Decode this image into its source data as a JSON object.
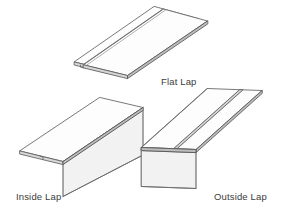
{
  "diagram": {
    "type": "technical-line-drawing",
    "projection": "isometric",
    "background_color": "#ffffff",
    "line_color": "#6a6a6a",
    "fill_color": "#fdfdfd",
    "shade_color": "#f2f2f2",
    "edge_color": "#d6d6d6",
    "text_color": "#3b3b3b"
  },
  "figures": [
    {
      "id": "flat-lap",
      "label": "Flat Lap",
      "description": "Two flat panels overlapping at a lap seam, no bend",
      "position": "top-center"
    },
    {
      "id": "inside-lap",
      "label": "Inside Lap",
      "description": "L-shaped profile with a vertical leg bent down at the near edge, lap seam on the underside",
      "position": "bottom-left"
    },
    {
      "id": "outside-lap",
      "label": "Outside Lap",
      "description": "L-shaped profile with a vertical leg bent down and an overlapping lap seam across the top face",
      "position": "bottom-right"
    }
  ],
  "captions": {
    "flat_lap": "Flat Lap",
    "inside_lap": "Inside Lap",
    "outside_lap": "Outside Lap"
  }
}
